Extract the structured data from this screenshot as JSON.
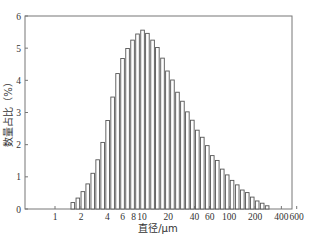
{
  "chart_data": {
    "type": "bar",
    "title": "",
    "xlabel": "直径/μm",
    "ylabel": "数量占比（%）",
    "xscale": "log",
    "xlim": [
      0.7,
      660
    ],
    "ylim": [
      0,
      6
    ],
    "grid": false,
    "legend": null,
    "x_ticks": [
      1,
      2,
      4,
      6,
      8,
      10,
      20,
      40,
      60,
      100,
      200,
      400,
      600
    ],
    "x_tick_labels": [
      "1",
      "2",
      "4",
      "6",
      "8",
      "10",
      "20",
      "40",
      "60",
      "100",
      "200",
      "400",
      "600"
    ],
    "y_ticks": [
      0,
      1,
      2,
      3,
      4,
      5,
      6
    ],
    "y_tick_labels": [
      "0",
      "1",
      "2",
      "3",
      "4",
      "5",
      "6"
    ],
    "categories": [
      1.61,
      1.84,
      2.1,
      2.39,
      2.73,
      3.11,
      3.55,
      4.05,
      4.62,
      5.27,
      6.01,
      6.86,
      7.83,
      8.93,
      10.2,
      11.6,
      13.3,
      15.1,
      17.3,
      19.7,
      22.5,
      25.7,
      29.3,
      33.4,
      38.1,
      43.5,
      49.6,
      56.6,
      64.6,
      73.7,
      84.1,
      95.9,
      109,
      125,
      143,
      163,
      186,
      212,
      242,
      276
    ],
    "values": [
      0.2,
      0.34,
      0.54,
      0.78,
      1.11,
      1.53,
      2.07,
      2.75,
      3.48,
      4.21,
      4.68,
      4.99,
      5.25,
      5.44,
      5.56,
      5.46,
      5.25,
      5.02,
      4.69,
      4.29,
      4.01,
      3.63,
      3.35,
      3.02,
      2.76,
      2.45,
      2.23,
      1.97,
      1.66,
      1.51,
      1.24,
      1.06,
      0.89,
      0.75,
      0.59,
      0.51,
      0.37,
      0.25,
      0.18,
      0.1
    ],
    "bar_fill": "#ffffff",
    "bar_edge": "#555555"
  }
}
